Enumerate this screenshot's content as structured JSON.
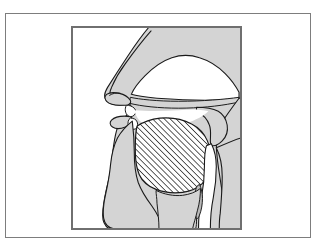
{
  "page": {
    "background_color": "#ffffff",
    "width": 319,
    "height": 247
  },
  "top_caption": {
    "text": "— — — — — —",
    "note_visible": "faint clipped text row at the very top edge",
    "color": "#b9b9b9"
  },
  "outer_frame": {
    "border_color": "#7d7d7d",
    "background_color": "#ffffff"
  },
  "figure_panel": {
    "border_color": "#6f6f6f",
    "background_color": "#ffffff"
  },
  "figure": {
    "type": "anatomical-line-diagram",
    "orientation": "facing left",
    "colors": {
      "tissue_fill": "#d4d4d4",
      "tissue_fill_light": "#dcdcdc",
      "outline": "#1a1a1a",
      "cavity_fill": "#ffffff",
      "hatch_line": "#2b2b2b",
      "hatch_background": "#ffffff"
    },
    "hatching": {
      "region": "tongue",
      "angle_degrees": 45,
      "spacing_px": 3,
      "line_width_px": 1
    },
    "parts": [
      {
        "name": "nasal-cavity",
        "fill": "#ffffff",
        "description": "large white cavity behind the nose"
      },
      {
        "name": "nose-and-upper-face",
        "fill": "#d4d4d4"
      },
      {
        "name": "hard-palate",
        "fill": "#d4d4d4"
      },
      {
        "name": "soft-palate-velum",
        "fill": "#d4d4d4"
      },
      {
        "name": "upper-lip",
        "fill": "#d4d4d4"
      },
      {
        "name": "lower-lip",
        "fill": "#d4d4d4"
      },
      {
        "name": "upper-teeth",
        "fill": "#ffffff"
      },
      {
        "name": "lower-teeth",
        "fill": "#ffffff"
      },
      {
        "name": "tongue",
        "fill": "hatched",
        "description": "cross-hatched diagonal fill"
      },
      {
        "name": "oral-cavity",
        "fill": "#ffffff"
      },
      {
        "name": "jaw-and-chin",
        "fill": "#d4d4d4"
      },
      {
        "name": "pharynx-airway",
        "fill": "#ffffff"
      },
      {
        "name": "epiglottis",
        "fill": "#d4d4d4"
      },
      {
        "name": "larynx-vocal-folds",
        "fill": "#d4d4d4"
      },
      {
        "name": "neck-posterior-wall",
        "fill": "#d4d4d4"
      },
      {
        "name": "skull-base",
        "fill": "#d4d4d4"
      }
    ]
  }
}
